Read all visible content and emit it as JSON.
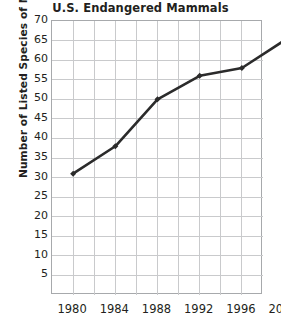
{
  "chart_data": {
    "type": "line",
    "title": "U.S. Endangered Mammals",
    "xlabel": "",
    "ylabel": "Number of Listed Species of Mammals",
    "x": [
      1980,
      1984,
      1988,
      1992,
      1996,
      2000
    ],
    "categories": [
      "1980",
      "1984",
      "1988",
      "1992",
      "1996",
      "2000"
    ],
    "values": [
      31,
      38,
      50,
      56,
      58,
      65
    ],
    "series": [
      {
        "name": "U.S. Endangered Mammals",
        "values": [
          31,
          38,
          50,
          56,
          58,
          65
        ]
      }
    ],
    "ylim": [
      0,
      70
    ],
    "xlim": [
      1978,
      2000
    ],
    "yticks": [
      70,
      65,
      60,
      55,
      50,
      45,
      40,
      35,
      30,
      25,
      20,
      15,
      10,
      5
    ],
    "ytick_labels": [
      "70",
      "65",
      "60",
      "55",
      "50",
      "45",
      "40",
      "35",
      "30",
      "25",
      "20",
      "15",
      "10",
      "5"
    ],
    "xtick_labels": [
      "1980",
      "1984",
      "1988",
      "1992",
      "1996",
      "2000"
    ],
    "grid": true,
    "grid_columns": 10,
    "legend": "none",
    "line_color": "#2b2b2b",
    "grid_color": "#c9cacc",
    "axis_color": "#a7a9ac",
    "text_color": "#231f20",
    "marker": "diamond"
  }
}
